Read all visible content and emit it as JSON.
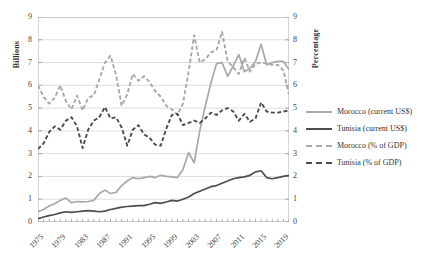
{
  "chart_data": {
    "type": "line",
    "title": "",
    "xlabel": "",
    "ylabel": "Billions",
    "y2label": "Percentage",
    "ylim": [
      0,
      9
    ],
    "y2lim": [
      0,
      9
    ],
    "grid": true,
    "legend_position": "right",
    "x": [
      1975,
      1976,
      1977,
      1978,
      1979,
      1980,
      1981,
      1982,
      1983,
      1984,
      1985,
      1986,
      1987,
      1988,
      1989,
      1990,
      1991,
      1992,
      1993,
      1994,
      1995,
      1996,
      1997,
      1998,
      1999,
      2000,
      2001,
      2002,
      2003,
      2004,
      2005,
      2006,
      2007,
      2008,
      2009,
      2010,
      2011,
      2012,
      2013,
      2014,
      2015,
      2016,
      2017,
      2018,
      2019,
      2020
    ],
    "xticks": [
      "1975",
      "1979",
      "1983",
      "1987",
      "1991",
      "1995",
      "1999",
      "2003",
      "2007",
      "2011",
      "2015",
      "2019"
    ],
    "yticks": [
      "0",
      "1",
      "2",
      "3",
      "4",
      "5",
      "6",
      "7",
      "8",
      "9"
    ],
    "y2ticks": [
      "0",
      "1",
      "2",
      "3",
      "4",
      "5",
      "6",
      "7",
      "8",
      "9"
    ],
    "series": [
      {
        "name": "Morocco (current US$)",
        "axis": "left",
        "style": "solid",
        "color": "#a8a8a8",
        "values": [
          0.45,
          0.55,
          0.7,
          0.8,
          0.95,
          1.05,
          0.85,
          0.9,
          0.88,
          0.9,
          0.95,
          1.25,
          1.4,
          1.25,
          1.3,
          1.6,
          1.8,
          1.95,
          1.9,
          1.95,
          2.0,
          1.95,
          2.05,
          2.0,
          1.98,
          1.95,
          2.3,
          3.05,
          2.6,
          4.0,
          5.1,
          6.1,
          6.95,
          7.0,
          6.4,
          6.85,
          7.35,
          6.6,
          6.75,
          7.05,
          7.8,
          6.9,
          7.0,
          7.05,
          7.05,
          6.7
        ]
      },
      {
        "name": "Tunisia (current US$)",
        "axis": "left",
        "style": "solid",
        "color": "#4d4d4d",
        "values": [
          0.15,
          0.22,
          0.28,
          0.33,
          0.4,
          0.45,
          0.42,
          0.45,
          0.48,
          0.5,
          0.48,
          0.45,
          0.48,
          0.55,
          0.6,
          0.65,
          0.68,
          0.7,
          0.72,
          0.72,
          0.78,
          0.85,
          0.82,
          0.88,
          0.95,
          0.92,
          1.0,
          1.1,
          1.25,
          1.35,
          1.45,
          1.55,
          1.6,
          1.7,
          1.8,
          1.9,
          1.95,
          1.98,
          2.05,
          2.2,
          2.25,
          1.95,
          1.9,
          1.95,
          2.0,
          2.05
        ]
      },
      {
        "name": "Morocco (% of GDP)",
        "axis": "right",
        "style": "dashed",
        "color": "#a8a8a8",
        "values": [
          6.0,
          5.5,
          5.2,
          5.45,
          6.0,
          5.3,
          4.95,
          5.55,
          4.9,
          5.45,
          5.55,
          6.25,
          7.0,
          7.3,
          6.45,
          5.1,
          5.6,
          6.5,
          6.2,
          6.4,
          6.15,
          5.75,
          5.5,
          5.1,
          4.95,
          4.7,
          5.2,
          6.6,
          8.2,
          7.0,
          7.15,
          7.45,
          7.55,
          8.35,
          7.05,
          6.8,
          6.5,
          7.2,
          6.6,
          6.95,
          7.0,
          6.95,
          6.9,
          6.9,
          6.65,
          5.6
        ]
      },
      {
        "name": "Tunisia (% of GDP)",
        "axis": "right",
        "style": "dashed",
        "color": "#4d4d4d",
        "values": [
          3.2,
          3.45,
          3.95,
          4.2,
          4.05,
          4.45,
          4.6,
          4.2,
          3.25,
          4.05,
          4.45,
          4.6,
          5.05,
          4.55,
          4.6,
          4.15,
          3.35,
          4.05,
          4.25,
          3.85,
          3.7,
          3.4,
          3.35,
          4.1,
          4.7,
          4.75,
          4.25,
          4.35,
          4.45,
          4.35,
          4.55,
          4.8,
          4.7,
          4.9,
          5.0,
          4.85,
          4.45,
          4.75,
          4.4,
          4.55,
          5.25,
          4.85,
          4.8,
          4.8,
          4.85,
          4.9
        ]
      }
    ]
  },
  "legend": {
    "items": [
      {
        "label": "Morocco (current US$)",
        "swatch": "sw-solid-light"
      },
      {
        "label": "Tunisia (current US$)",
        "swatch": "sw-solid-dark"
      },
      {
        "label": "Morocco (% of GDP)",
        "swatch": "sw-dash-light"
      },
      {
        "label": "Tunisia (% of GDP)",
        "swatch": "sw-dash-dark"
      }
    ]
  }
}
